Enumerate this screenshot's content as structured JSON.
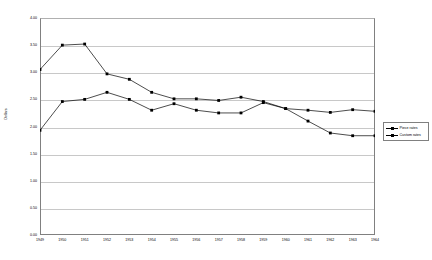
{
  "chart_data": {
    "type": "line",
    "title": "",
    "xlabel": "",
    "ylabel": "Dollars",
    "ylim": [
      0.0,
      4.0
    ],
    "ytick_step": 0.5,
    "grid": true,
    "legend_position": "right",
    "categories": [
      "1949",
      "1950",
      "1951",
      "1952",
      "1953",
      "1954",
      "1955",
      "1956",
      "1957",
      "1958",
      "1959",
      "1960",
      "1961",
      "1962",
      "1963",
      "1964"
    ],
    "series": [
      {
        "name": "Piece rates",
        "values": [
          3.05,
          3.5,
          3.52,
          2.97,
          2.87,
          2.63,
          2.51,
          2.51,
          2.48,
          2.54,
          2.46,
          2.33,
          2.1,
          1.88,
          1.83,
          1.83
        ]
      },
      {
        "name": "Custom rates",
        "values": [
          1.93,
          2.46,
          2.5,
          2.63,
          2.5,
          2.3,
          2.42,
          2.3,
          2.25,
          2.25,
          2.44,
          2.33,
          2.3,
          2.26,
          2.31,
          2.28
        ]
      }
    ],
    "ytick_labels": [
      "0.00",
      "0.50",
      "1.00",
      "1.50",
      "2.00",
      "2.50",
      "3.00",
      "3.50",
      "4.00"
    ],
    "colors": {
      "series": "#000000",
      "gridline": "#c8c8c8",
      "axis": "#808080",
      "background": "#ffffff"
    }
  },
  "legend": {
    "items": [
      {
        "label": "Piece rates"
      },
      {
        "label": "Custom rates"
      }
    ]
  }
}
